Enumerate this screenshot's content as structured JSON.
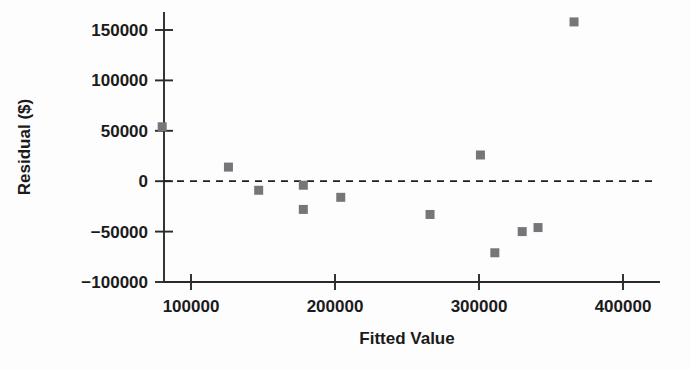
{
  "chart_data": {
    "type": "scatter",
    "title": "",
    "xlabel": "Fitted Value",
    "ylabel": "Residual ($)",
    "xlim": [
      60000,
      420000
    ],
    "ylim": [
      -110000,
      165000
    ],
    "xticks": [
      100000,
      200000,
      300000,
      400000
    ],
    "xtick_labels": [
      "100000",
      "200000",
      "300000",
      "400000"
    ],
    "yticks": [
      -100000,
      -50000,
      0,
      50000,
      100000,
      150000
    ],
    "ytick_labels": [
      "-100000",
      "-50000",
      "0",
      "50000",
      "100000",
      "150000"
    ],
    "grid": false,
    "legend": null,
    "reference_line": {
      "y": 0,
      "style": "dashed",
      "color": "#1f1f1f"
    },
    "marker": {
      "shape": "square",
      "color": "#76767a",
      "size": 9
    },
    "points": [
      {
        "x": 80000,
        "y": 54000
      },
      {
        "x": 126000,
        "y": 14000
      },
      {
        "x": 147000,
        "y": -9000
      },
      {
        "x": 178000,
        "y": -4000
      },
      {
        "x": 178000,
        "y": -28000
      },
      {
        "x": 204000,
        "y": -16000
      },
      {
        "x": 266000,
        "y": -33000
      },
      {
        "x": 301000,
        "y": 26000
      },
      {
        "x": 311000,
        "y": -71000
      },
      {
        "x": 330000,
        "y": -50000
      },
      {
        "x": 341000,
        "y": -46000
      },
      {
        "x": 366000,
        "y": 158000
      }
    ]
  },
  "labels": {
    "x_axis_title": "Fitted Value",
    "y_axis_title": "Residual ($)"
  },
  "colors": {
    "marker": "#76767a",
    "axis": "#2a2a2a",
    "text": "#1b1b1b",
    "reference": "#1f1f1f",
    "background": "#fdfdfd"
  }
}
